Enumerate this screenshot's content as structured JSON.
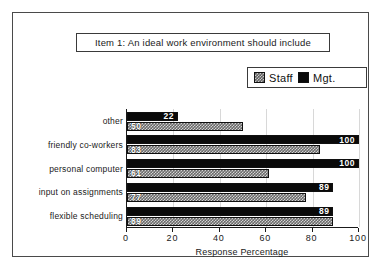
{
  "title": {
    "text": "Item 1:  An ideal work environment should include"
  },
  "legend": {
    "position": "top-right",
    "entries": [
      {
        "label": "Staff",
        "swatch": "hatched-gray",
        "color": "#6a6a6a"
      },
      {
        "label": "Mgt.",
        "swatch": "solid-black",
        "color": "#0a0a0a"
      }
    ]
  },
  "axis": {
    "xlabel": "Response Percentage",
    "ticks": [
      "0",
      "20",
      "40",
      "60",
      "80",
      "100"
    ]
  },
  "chart_data": {
    "type": "bar",
    "orientation": "horizontal",
    "title": "Item 1:  An ideal work environment should include",
    "xlabel": "Response Percentage",
    "ylabel": "",
    "xlim": [
      0,
      100
    ],
    "xticks": [
      0,
      20,
      40,
      60,
      80,
      100
    ],
    "grid": true,
    "legend_position": "top-right",
    "categories": [
      "other",
      "friendly  co-workers",
      "personal computer",
      "input on assignments",
      "flexible  scheduling"
    ],
    "series": [
      {
        "name": "Mgt.",
        "color": "#0a0a0a",
        "values": [
          22,
          100,
          100,
          89,
          89
        ]
      },
      {
        "name": "Staff",
        "color": "#6a6a6a",
        "values": [
          50,
          83,
          61,
          77,
          89
        ]
      }
    ]
  }
}
